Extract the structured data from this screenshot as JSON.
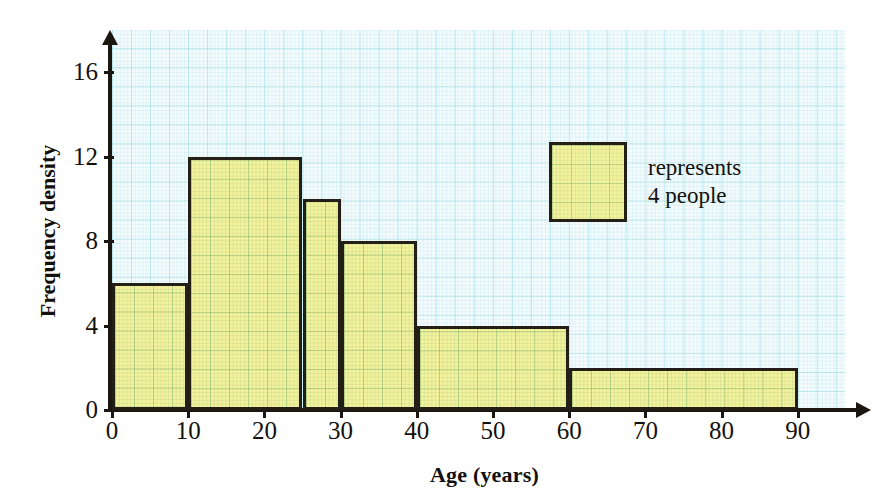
{
  "chart_data": {
    "type": "bar",
    "title": "",
    "subtitle": "",
    "xlabel": "Age (years)",
    "ylabel": "Frequency density",
    "xlim": [
      0,
      90
    ],
    "ylim": [
      0,
      18
    ],
    "grid": true,
    "grid_style": "graph-paper",
    "x_ticks": [
      0,
      10,
      20,
      30,
      40,
      50,
      60,
      70,
      80,
      90
    ],
    "x_tick_labels": [
      "0",
      "10",
      "20",
      "30",
      "40",
      "50",
      "60",
      "70",
      "80",
      "90"
    ],
    "y_ticks": [
      0,
      4,
      8,
      12,
      16
    ],
    "y_tick_labels": [
      "0",
      "4",
      "8",
      "12",
      "16"
    ],
    "bar_fill_color": "#F4F29B",
    "bar_edge_color": "#231f16",
    "grid_line_color": "#6ECDD7",
    "axis_color": "#1b1710",
    "bins": [
      {
        "label": "0-10",
        "x_start": 0,
        "x_end": 10,
        "frequency_density": 6,
        "frequency": 60
      },
      {
        "label": "10-25",
        "x_start": 10,
        "x_end": 25,
        "frequency_density": 12,
        "frequency": 180
      },
      {
        "label": "25-30",
        "x_start": 25,
        "x_end": 30,
        "frequency_density": 10,
        "frequency": 50
      },
      {
        "label": "30-40",
        "x_start": 30,
        "x_end": 40,
        "frequency_density": 8,
        "frequency": 80
      },
      {
        "label": "40-60",
        "x_start": 40,
        "x_end": 60,
        "frequency_density": 4,
        "frequency": 80
      },
      {
        "label": "60-90",
        "x_start": 60,
        "x_end": 90,
        "frequency_density": 2,
        "frequency": 60
      }
    ],
    "legend": {
      "position": "inside-upper-right",
      "swatch_label_line1": "represents",
      "swatch_label_line2": "4 people",
      "swatch_meaning": "one square of the grid represents 4 people"
    },
    "annotations": []
  },
  "axis": {
    "x_title": "Age (years)",
    "y_title": "Frequency density"
  }
}
